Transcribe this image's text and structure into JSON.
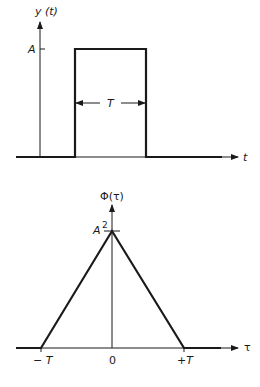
{
  "top_plot": {
    "y_axis_label": "y (t)",
    "x_axis_label": "t",
    "amplitude_label": "A",
    "width_label": "T"
  },
  "bottom_plot": {
    "y_axis_label": "Φ(τ)",
    "x_axis_label": "τ",
    "peak_label": "A",
    "peak_exponent": "2",
    "tick_labels": [
      "− T",
      "0",
      "+T"
    ]
  },
  "colors": {
    "line": "#1a1a1a",
    "background": "#ffffff"
  }
}
